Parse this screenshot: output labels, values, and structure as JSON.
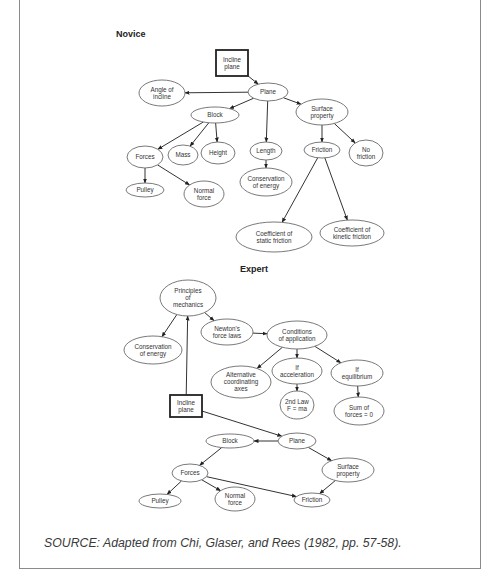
{
  "novice": {
    "title": "Novice",
    "nodes": [
      {
        "id": "incline",
        "shape": "box",
        "lines": [
          "Incline",
          "plane"
        ],
        "x": 232,
        "y": 63,
        "w": 32,
        "h": 26
      },
      {
        "id": "plane",
        "shape": "ellipse",
        "lines": [
          "Plane"
        ],
        "x": 268,
        "y": 92,
        "w": 40,
        "h": 18
      },
      {
        "id": "angle",
        "shape": "ellipse",
        "lines": [
          "Angle of",
          "incline"
        ],
        "x": 162,
        "y": 93,
        "w": 46,
        "h": 26
      },
      {
        "id": "block",
        "shape": "ellipse",
        "lines": [
          "Block"
        ],
        "x": 215,
        "y": 115,
        "w": 48,
        "h": 16
      },
      {
        "id": "surface",
        "shape": "ellipse",
        "lines": [
          "Surface",
          "property"
        ],
        "x": 322,
        "y": 112,
        "w": 52,
        "h": 26
      },
      {
        "id": "forces",
        "shape": "ellipse",
        "lines": [
          "Forces"
        ],
        "x": 145,
        "y": 157,
        "w": 36,
        "h": 22
      },
      {
        "id": "mass",
        "shape": "ellipse",
        "lines": [
          "Mass"
        ],
        "x": 183,
        "y": 155,
        "w": 30,
        "h": 20
      },
      {
        "id": "height",
        "shape": "ellipse",
        "lines": [
          "Height"
        ],
        "x": 218,
        "y": 153,
        "w": 34,
        "h": 22
      },
      {
        "id": "length",
        "shape": "ellipse",
        "lines": [
          "Length"
        ],
        "x": 266,
        "y": 151,
        "w": 32,
        "h": 18
      },
      {
        "id": "friction",
        "shape": "ellipse",
        "lines": [
          "Friction"
        ],
        "x": 322,
        "y": 150,
        "w": 36,
        "h": 16
      },
      {
        "id": "nofriction",
        "shape": "ellipse",
        "lines": [
          "No",
          "friction"
        ],
        "x": 366,
        "y": 153,
        "w": 34,
        "h": 26
      },
      {
        "id": "conservation",
        "shape": "ellipse",
        "lines": [
          "Conservation",
          "of energy"
        ],
        "x": 266,
        "y": 182,
        "w": 52,
        "h": 28
      },
      {
        "id": "pulley",
        "shape": "ellipse",
        "lines": [
          "Pulley"
        ],
        "x": 145,
        "y": 190,
        "w": 38,
        "h": 14
      },
      {
        "id": "normal",
        "shape": "ellipse",
        "lines": [
          "Normal",
          "force"
        ],
        "x": 204,
        "y": 194,
        "w": 40,
        "h": 26
      },
      {
        "id": "static",
        "shape": "ellipse",
        "lines": [
          "Coefficient of",
          "static friction"
        ],
        "x": 274,
        "y": 237,
        "w": 76,
        "h": 30
      },
      {
        "id": "kinetic",
        "shape": "ellipse",
        "lines": [
          "Coefficient of",
          "kinetic friction"
        ],
        "x": 352,
        "y": 233,
        "w": 64,
        "h": 26
      }
    ],
    "edges": [
      [
        "incline",
        "plane"
      ],
      [
        "plane",
        "angle"
      ],
      [
        "plane",
        "block"
      ],
      [
        "plane",
        "surface"
      ],
      [
        "plane",
        "length"
      ],
      [
        "block",
        "forces"
      ],
      [
        "block",
        "mass"
      ],
      [
        "block",
        "height"
      ],
      [
        "length",
        "conservation"
      ],
      [
        "surface",
        "friction"
      ],
      [
        "surface",
        "nofriction"
      ],
      [
        "forces",
        "pulley"
      ],
      [
        "forces",
        "normal"
      ],
      [
        "friction",
        "static"
      ],
      [
        "friction",
        "kinetic"
      ]
    ]
  },
  "expert": {
    "title": "Expert",
    "nodes": [
      {
        "id": "principles",
        "shape": "ellipse",
        "lines": [
          "Principles",
          "of",
          "mechanics"
        ],
        "x": 188,
        "y": 298,
        "w": 56,
        "h": 36
      },
      {
        "id": "newton",
        "shape": "ellipse",
        "lines": [
          "Newton's",
          "force laws"
        ],
        "x": 227,
        "y": 332,
        "w": 52,
        "h": 26
      },
      {
        "id": "conservation",
        "shape": "ellipse",
        "lines": [
          "Conservation",
          "of energy"
        ],
        "x": 153,
        "y": 350,
        "w": 58,
        "h": 28
      },
      {
        "id": "conditions",
        "shape": "ellipse",
        "lines": [
          "Conditions",
          "of application"
        ],
        "x": 297,
        "y": 335,
        "w": 60,
        "h": 28
      },
      {
        "id": "alternative",
        "shape": "ellipse",
        "lines": [
          "Alternative",
          "coordinating",
          "axes"
        ],
        "x": 241,
        "y": 382,
        "w": 60,
        "h": 32
      },
      {
        "id": "ifacc",
        "shape": "ellipse",
        "lines": [
          "If",
          "acceleration"
        ],
        "x": 297,
        "y": 371,
        "w": 50,
        "h": 26
      },
      {
        "id": "ifeq",
        "shape": "ellipse",
        "lines": [
          "If",
          "equilibrium"
        ],
        "x": 357,
        "y": 373,
        "w": 52,
        "h": 26
      },
      {
        "id": "secondlaw",
        "shape": "ellipse",
        "lines": [
          "2nd Law",
          "F = ma"
        ],
        "x": 297,
        "y": 405,
        "w": 34,
        "h": 28
      },
      {
        "id": "sumforces",
        "shape": "ellipse",
        "lines": [
          "Sum of",
          "forces = 0"
        ],
        "x": 359,
        "y": 411,
        "w": 50,
        "h": 28
      },
      {
        "id": "incline",
        "shape": "box",
        "lines": [
          "Incline",
          "plane"
        ],
        "x": 186,
        "y": 406,
        "w": 32,
        "h": 22
      },
      {
        "id": "block",
        "shape": "ellipse",
        "lines": [
          "Block"
        ],
        "x": 230,
        "y": 441,
        "w": 48,
        "h": 14
      },
      {
        "id": "plane",
        "shape": "ellipse",
        "lines": [
          "Plane"
        ],
        "x": 297,
        "y": 441,
        "w": 38,
        "h": 16
      },
      {
        "id": "forces",
        "shape": "ellipse",
        "lines": [
          "Forces"
        ],
        "x": 190,
        "y": 473,
        "w": 36,
        "h": 18
      },
      {
        "id": "surface",
        "shape": "ellipse",
        "lines": [
          "Surface",
          "property"
        ],
        "x": 348,
        "y": 470,
        "w": 52,
        "h": 24
      },
      {
        "id": "pulley",
        "shape": "ellipse",
        "lines": [
          "Pulley"
        ],
        "x": 160,
        "y": 501,
        "w": 42,
        "h": 14
      },
      {
        "id": "normal",
        "shape": "ellipse",
        "lines": [
          "Normal",
          "force"
        ],
        "x": 235,
        "y": 499,
        "w": 40,
        "h": 24
      },
      {
        "id": "friction",
        "shape": "ellipse",
        "lines": [
          "Friction"
        ],
        "x": 312,
        "y": 500,
        "w": 36,
        "h": 14
      }
    ],
    "edges": [
      [
        "principles",
        "conservation"
      ],
      [
        "principles",
        "newton"
      ],
      [
        "newton",
        "conditions"
      ],
      [
        "conditions",
        "alternative"
      ],
      [
        "conditions",
        "ifacc"
      ],
      [
        "conditions",
        "ifeq"
      ],
      [
        "ifacc",
        "secondlaw"
      ],
      [
        "ifeq",
        "sumforces"
      ],
      [
        "incline",
        "principles"
      ],
      [
        "incline",
        "plane"
      ],
      [
        "plane",
        "block"
      ],
      [
        "plane",
        "surface"
      ],
      [
        "block",
        "forces"
      ],
      [
        "forces",
        "pulley"
      ],
      [
        "forces",
        "normal"
      ],
      [
        "forces",
        "friction"
      ],
      [
        "surface",
        "friction"
      ]
    ]
  },
  "source": "SOURCE: Adapted from Chi, Glaser, and Rees (1982, pp. 57-58)."
}
